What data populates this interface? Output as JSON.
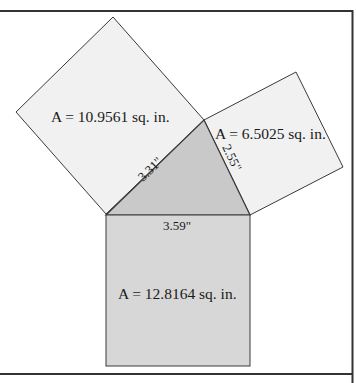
{
  "colors": {
    "background": "#ffffff",
    "border": "#333333",
    "outline": "#3a3a3a",
    "leg_square_fill": "#f1f1f1",
    "triangle_fill": "#c9c9c9",
    "hypotenuse_square_fill": "#d7d7d7",
    "text": "#1a1a1a"
  },
  "squares": {
    "left": {
      "area_label": "A = 10.9561 sq. in.",
      "side_label": "3.31\""
    },
    "right": {
      "area_label": "A = 6.5025 sq. in.",
      "side_label": "2.55\""
    },
    "bottom": {
      "area_label": "A = 12.8164 sq. in.",
      "side_label": "3.59\""
    }
  }
}
